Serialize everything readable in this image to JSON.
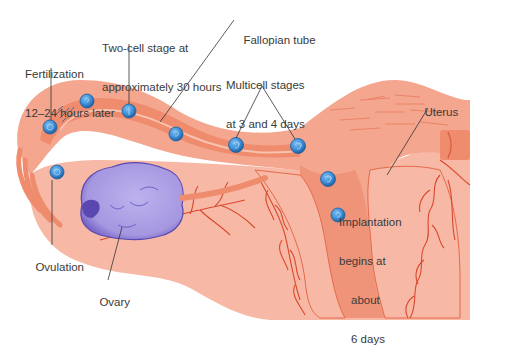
{
  "figure": {
    "type": "anatomical-illustration",
    "colors": {
      "background": "#ffffff",
      "tissue_outer": "#f4a68e",
      "tissue_main": "#f08c6e",
      "tissue_dark": "#e5694a",
      "tissue_light": "#f8bfae",
      "uterus_inner": "#f6b3a0",
      "vessel": "#d9482c",
      "ovary": "#a89be0",
      "ovary_dark": "#5a48b0",
      "embryo": "#3f8ed6",
      "embryo_dark": "#1f5f9f",
      "leader_line": "#333333",
      "label_text": "#3a3a3a"
    }
  },
  "labels": {
    "fertilization": {
      "line1": "Fertilization",
      "line2": "12–24 hours later"
    },
    "two_cell": {
      "line1": "Two-cell stage at",
      "line2": "approximately 30 hours"
    },
    "fallopian_tube": {
      "text": "Fallopian tube"
    },
    "multicell": {
      "line1": "Multicell stages",
      "line2": "at 3 and 4 days"
    },
    "uterus": {
      "text": "Uterus"
    },
    "implantation": {
      "line1": "Implantation",
      "line2": "begins at",
      "line3": "about",
      "line4": "6 days"
    },
    "ovulation": {
      "text": "Ovulation"
    },
    "ovary": {
      "text": "Ovary"
    }
  },
  "embryos": [
    {
      "stage": "ovulated egg",
      "x": 57,
      "y": 172
    },
    {
      "stage": "fertilization",
      "x": 50,
      "y": 127
    },
    {
      "stage": "early",
      "x": 87,
      "y": 101
    },
    {
      "stage": "two-cell",
      "x": 129,
      "y": 111
    },
    {
      "stage": "cleavage",
      "x": 176,
      "y": 134
    },
    {
      "stage": "multicell day 3",
      "x": 236,
      "y": 145
    },
    {
      "stage": "multicell day 4",
      "x": 298,
      "y": 146
    },
    {
      "stage": "morula",
      "x": 328,
      "y": 179
    },
    {
      "stage": "blastocyst implanting",
      "x": 338,
      "y": 215
    }
  ]
}
